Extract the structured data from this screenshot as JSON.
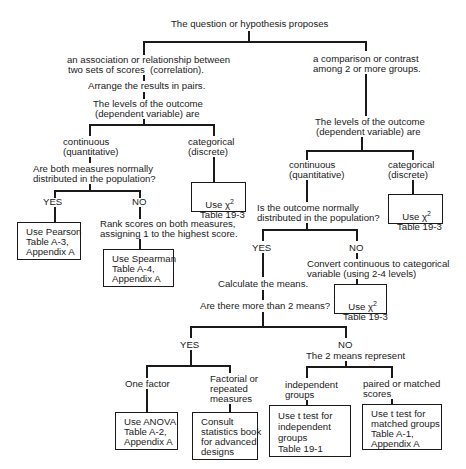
{
  "root": "The question or hypothesis proposes",
  "left": {
    "title_line1": "an association or relationship between",
    "title_line2": "two sets of scores  (correlation).",
    "step": "Arrange the results in pairs.",
    "levels_line1": "The levels of the outcome",
    "levels_line2": "(dependent variable) are",
    "continuous_line1": "continuous",
    "continuous_line2": "(quantitative)",
    "categorical_line1": "categorical",
    "categorical_line2": "(discrete)",
    "question_line1": "Are both measures normally",
    "question_line2": "distributed in the population?",
    "yes": "YES",
    "no": "NO",
    "rank_line1": "Rank scores on both measures,",
    "rank_line2": "assigning 1 to the highest score.",
    "pearson_box": "Use Pearson\nTable A-3,\nAppendix A",
    "spearman_box": "Use Spearman\nTable A-4,\nAppendix A",
    "chi_use": "Use χ",
    "chi_sup": "2",
    "chi_table": "Table 19-3"
  },
  "right": {
    "title_line1": "a comparison or contrast",
    "title_line2": "among 2 or more groups.",
    "levels_line1": "The levels of the outcome",
    "levels_line2": "(dependent variable) are",
    "continuous_line1": "continuous",
    "continuous_line2": "(quantitative)",
    "categorical_line1": "categorical",
    "categorical_line2": "(discrete)",
    "chi_use": "Use χ",
    "chi_sup": "2",
    "chi_table": "Table 19-3",
    "question_line1": "Is the outcome normally",
    "question_line2": "distributed in the population?",
    "yes": "YES",
    "no": "NO",
    "convert_line1": "Convert continuous to categorical",
    "convert_line2": "variable (using 2-4 levels)",
    "chi2_use": "Use χ",
    "chi2_sup": "2",
    "chi2_table": "Table 19-3",
    "calc_means": "Calculate the means.",
    "more_means": "Are there more than 2 means?",
    "yes2": "YES",
    "no2": "NO",
    "two_means": "The 2 means represent",
    "one_factor": "One factor",
    "factorial": "Factorial or\nrepeated\nmeasures",
    "independent": "independent\ngroups",
    "paired": "paired or matched\nscores",
    "anova_box": "Use ANOVA\nTable A-2,\nAppendix A",
    "consult_box": "Consult\nstatistics book\nfor advanced\ndesigns",
    "ttest_ind_box": "Use t test for\nindependent\ngroups\nTable 19-1",
    "ttest_match_box": "Use t test for\nmatched groups\nTable A-1,\nAppendix A"
  }
}
